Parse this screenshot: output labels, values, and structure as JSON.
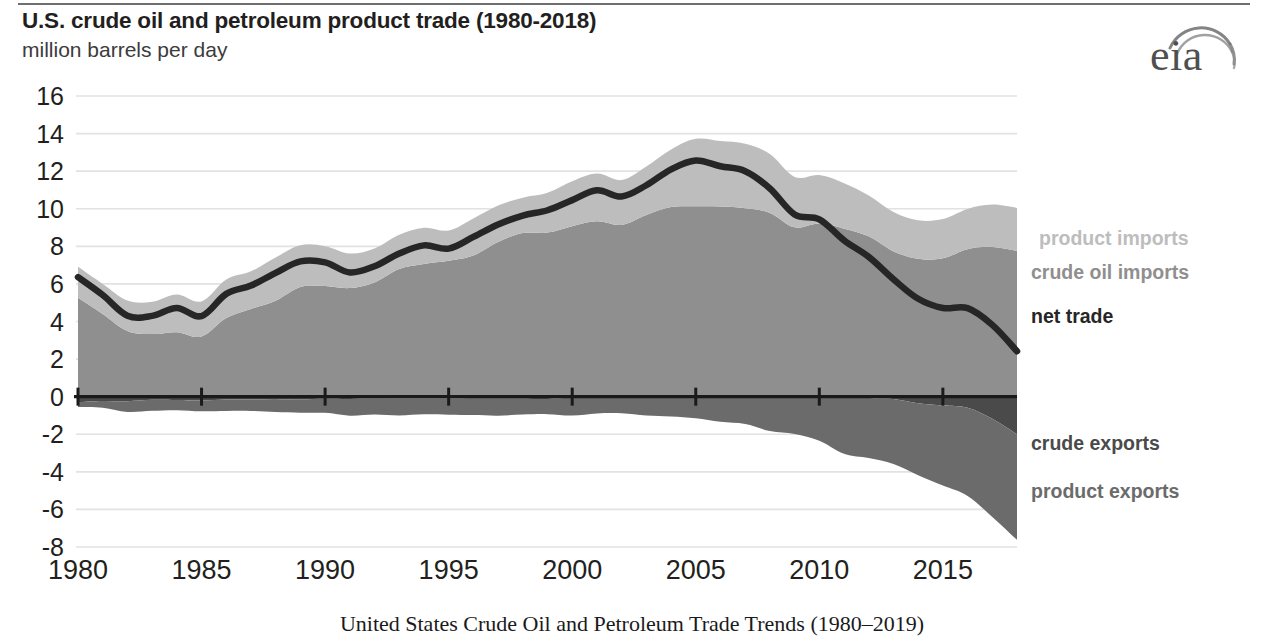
{
  "header": {
    "title": "U.S. crude oil and petroleum product trade (1980-2018)",
    "subtitle": "million barrels per day",
    "logo_text": "eia",
    "logo_name": "eia-logo"
  },
  "caption": "United States Crude Oil and Petroleum Trade Trends (1980–2019)",
  "labels": {
    "product_imports": "product imports",
    "crude_oil_imports": "crude oil imports",
    "net_trade": "net trade",
    "crude_exports": "crude exports",
    "product_exports": "product exports"
  },
  "colors": {
    "product_imports": "#bdbdbd",
    "crude_oil_imports": "#8f8f8f",
    "net_trade": "#262626",
    "crude_exports": "#4a4a4a",
    "product_exports": "#6b6b6b",
    "grid": "#e2e2e2",
    "axis": "#1a1a1a",
    "text": "#231f20"
  },
  "chart_data": {
    "type": "area",
    "title": "U.S. crude oil and petroleum product trade (1980-2018)",
    "subtitle": "million barrels per day",
    "xlabel": "",
    "ylabel": "million barrels per day",
    "ylim": [
      -8,
      16
    ],
    "xlim": [
      1980,
      2018
    ],
    "ytick_step": 2,
    "yticks": [
      16,
      14,
      12,
      10,
      8,
      6,
      4,
      2,
      0,
      -2,
      -4,
      -6,
      -8
    ],
    "xticks": [
      1980,
      1985,
      1990,
      1995,
      2000,
      2005,
      2010,
      2015
    ],
    "grid": true,
    "legend": "right-inline",
    "stacking": "diverging-stacked",
    "x": [
      1980,
      1981,
      1982,
      1983,
      1984,
      1985,
      1986,
      1987,
      1988,
      1989,
      1990,
      1991,
      1992,
      1993,
      1994,
      1995,
      1996,
      1997,
      1998,
      1999,
      2000,
      2001,
      2002,
      2003,
      2004,
      2005,
      2006,
      2007,
      2008,
      2009,
      2010,
      2011,
      2012,
      2013,
      2014,
      2015,
      2016,
      2017,
      2018
    ],
    "series": [
      {
        "name": "crude oil imports",
        "key": "crude_oil_imports",
        "sign": "positive",
        "values": [
          5.26,
          4.4,
          3.49,
          3.33,
          3.43,
          3.2,
          4.18,
          4.67,
          5.11,
          5.84,
          5.89,
          5.78,
          6.08,
          6.79,
          7.06,
          7.23,
          7.51,
          8.23,
          8.71,
          8.73,
          9.07,
          9.33,
          9.14,
          9.67,
          10.09,
          10.13,
          10.12,
          10.03,
          9.78,
          9.01,
          9.21,
          8.94,
          8.53,
          7.73,
          7.34,
          7.36,
          7.85,
          7.97,
          7.76
        ],
        "color": "#8f8f8f"
      },
      {
        "name": "product imports",
        "key": "product_imports",
        "sign": "positive",
        "values": [
          1.65,
          1.6,
          1.63,
          1.72,
          2.01,
          1.87,
          2.05,
          2.0,
          2.3,
          2.22,
          2.12,
          1.84,
          1.81,
          1.83,
          1.93,
          1.61,
          1.97,
          1.94,
          1.88,
          2.12,
          2.39,
          2.54,
          2.39,
          2.58,
          3.06,
          3.59,
          3.48,
          3.43,
          3.13,
          2.68,
          2.58,
          2.42,
          2.18,
          2.1,
          2.05,
          2.09,
          2.14,
          2.25,
          2.28
        ],
        "color": "#bdbdbd"
      },
      {
        "name": "crude exports",
        "key": "crude_exports",
        "sign": "negative",
        "values": [
          -0.29,
          -0.23,
          -0.24,
          -0.17,
          -0.18,
          -0.2,
          -0.15,
          -0.15,
          -0.16,
          -0.14,
          -0.11,
          -0.12,
          -0.09,
          -0.1,
          -0.1,
          -0.1,
          -0.11,
          -0.11,
          -0.11,
          -0.12,
          -0.05,
          -0.02,
          -0.01,
          -0.01,
          -0.03,
          -0.03,
          -0.03,
          -0.03,
          -0.03,
          -0.04,
          -0.04,
          -0.05,
          -0.07,
          -0.13,
          -0.35,
          -0.47,
          -0.59,
          -1.18,
          -2.0
        ],
        "color": "#4a4a4a"
      },
      {
        "name": "product exports",
        "key": "product_exports",
        "sign": "negative",
        "values": [
          -0.26,
          -0.36,
          -0.57,
          -0.58,
          -0.54,
          -0.58,
          -0.61,
          -0.61,
          -0.66,
          -0.72,
          -0.75,
          -0.89,
          -0.86,
          -0.9,
          -0.84,
          -0.86,
          -0.87,
          -0.9,
          -0.84,
          -0.81,
          -0.95,
          -0.87,
          -0.87,
          -0.99,
          -1.02,
          -1.12,
          -1.31,
          -1.43,
          -1.8,
          -1.95,
          -2.31,
          -2.99,
          -3.2,
          -3.45,
          -3.83,
          -4.26,
          -4.69,
          -5.22,
          -5.62
        ],
        "color": "#6b6b6b"
      },
      {
        "name": "net trade",
        "key": "net_trade",
        "sign": "line",
        "values": [
          6.36,
          5.41,
          4.31,
          4.3,
          4.72,
          4.29,
          5.47,
          5.91,
          6.59,
          7.2,
          7.15,
          6.61,
          6.94,
          7.62,
          8.05,
          7.88,
          8.5,
          9.16,
          9.64,
          9.92,
          10.46,
          10.98,
          10.65,
          11.25,
          12.1,
          12.57,
          12.26,
          12.0,
          11.08,
          9.7,
          9.44,
          8.32,
          7.44,
          6.25,
          5.21,
          4.72,
          4.71,
          3.82,
          2.42
        ],
        "color": "#262626"
      }
    ]
  },
  "plot_geometry": {
    "left": 78,
    "right": 1017,
    "top": 96,
    "bottom": 547
  }
}
